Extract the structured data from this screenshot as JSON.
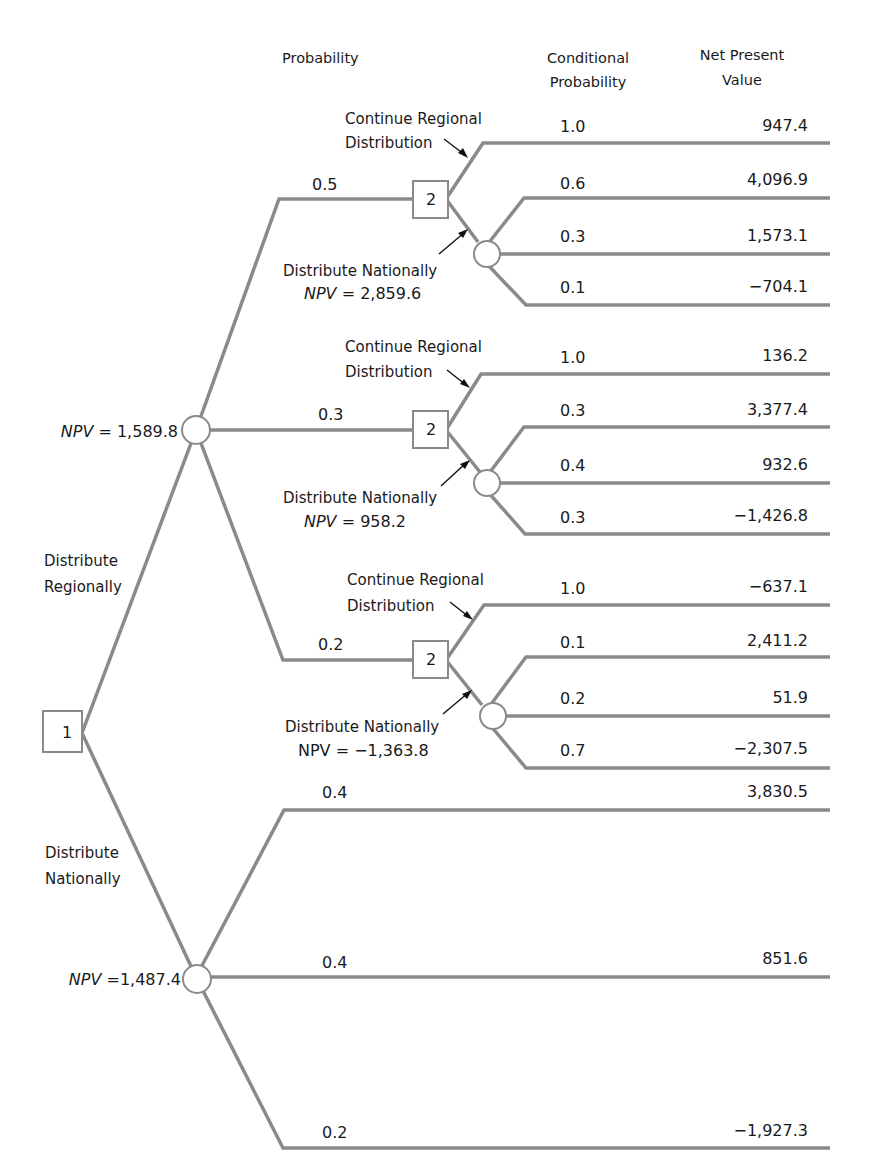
{
  "headers": {
    "probability": "Probability",
    "conditional_probability": [
      "Conditional",
      "Probability"
    ],
    "net_present_value": [
      "Net Present",
      "Value"
    ]
  },
  "root": {
    "decision_node_label": "1",
    "branch_regional_label": [
      "Distribute",
      "Regionally"
    ],
    "branch_national_label": [
      "Distribute",
      "Nationally"
    ]
  },
  "regional_chance": {
    "npv_label": "NPV = 1,589.8",
    "npv_prefix": "NPV",
    "npv_value": "= 1,589.8",
    "outcomes": [
      {
        "probability": "0.5",
        "decision_node_label": "2",
        "continue_label": [
          "Continue Regional",
          "Distribution"
        ],
        "national_label": "Distribute Nationally",
        "national_npv_prefix": "NPV",
        "national_npv_value": "= 2,859.6",
        "continue_cond_prob": "1.0",
        "continue_npv": "947.4",
        "national_outcomes": [
          {
            "cond_prob": "0.6",
            "npv": "4,096.9"
          },
          {
            "cond_prob": "0.3",
            "npv": "1,573.1"
          },
          {
            "cond_prob": "0.1",
            "npv": "−704.1"
          }
        ]
      },
      {
        "probability": "0.3",
        "decision_node_label": "2",
        "continue_label": [
          "Continue Regional",
          "Distribution"
        ],
        "national_label": "Distribute Nationally",
        "national_npv_prefix": "NPV",
        "national_npv_value": "= 958.2",
        "continue_cond_prob": "1.0",
        "continue_npv": "136.2",
        "national_outcomes": [
          {
            "cond_prob": "0.3",
            "npv": "3,377.4"
          },
          {
            "cond_prob": "0.4",
            "npv": "932.6"
          },
          {
            "cond_prob": "0.3",
            "npv": "−1,426.8"
          }
        ]
      },
      {
        "probability": "0.2",
        "decision_node_label": "2",
        "continue_label": [
          "Continue Regional",
          "Distribution"
        ],
        "national_label": "Distribute Nationally",
        "national_npv_prefix": "NPV",
        "national_npv_value": "= −1,363.8",
        "continue_cond_prob": "1.0",
        "continue_npv": "−637.1",
        "national_outcomes": [
          {
            "cond_prob": "0.1",
            "npv": "2,411.2"
          },
          {
            "cond_prob": "0.2",
            "npv": "51.9"
          },
          {
            "cond_prob": "0.7",
            "npv": "−2,307.5"
          }
        ]
      }
    ]
  },
  "national_chance": {
    "npv_prefix": "NPV",
    "npv_value": "=1,487.4",
    "outcomes": [
      {
        "probability": "0.4",
        "npv": "3,830.5"
      },
      {
        "probability": "0.4",
        "npv": "851.6"
      },
      {
        "probability": "0.2",
        "npv": "−1,927.3"
      }
    ]
  },
  "colors": {
    "line": "#8a8a8a",
    "text": "#1a1a1a",
    "background": "#ffffff"
  }
}
